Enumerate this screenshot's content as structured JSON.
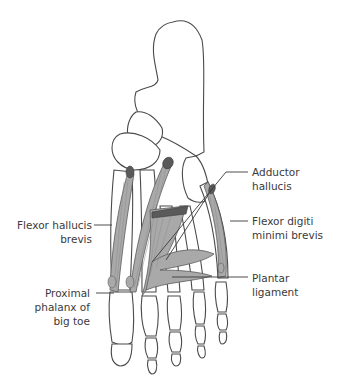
{
  "diagram": {
    "colors": {
      "bone_fill": "#ffffff",
      "bone_stroke": "#4a4a4a",
      "muscle_fill": "#a9a9a9",
      "muscle_line": "#8c8c8c",
      "attachment_dark": "#5a5a5a",
      "leader_line": "#3a3a3a",
      "text": "#3a3a3a"
    },
    "labels": [
      {
        "id": "adductor-hallucis",
        "lines": [
          "Adductor",
          "hallucis"
        ]
      },
      {
        "id": "flexor-hallucis-brevis",
        "lines": [
          "Flexor hallucis",
          "brevis"
        ]
      },
      {
        "id": "flexor-digiti-minimi-brevis",
        "lines": [
          "Flexor digiti",
          "minimi brevis"
        ]
      },
      {
        "id": "plantar-ligament",
        "lines": [
          "Plantar",
          "ligament"
        ]
      },
      {
        "id": "proximal-phalanx",
        "lines": [
          "Proximal",
          "phalanx of",
          "big toe"
        ]
      }
    ]
  }
}
